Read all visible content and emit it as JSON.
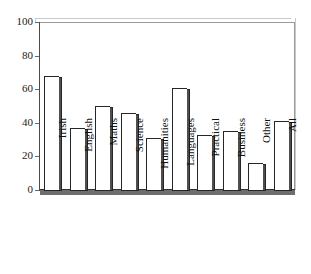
{
  "chart_data": {
    "type": "bar",
    "title": "",
    "xlabel": "",
    "ylabel": "",
    "ylim": [
      0,
      100
    ],
    "yticks": [
      0,
      20,
      40,
      60,
      80,
      100
    ],
    "grid": false,
    "legend": "none",
    "categories": [
      "Irish",
      "English",
      "Maths",
      "Science",
      "Humanities",
      "Languages",
      "Practical",
      "Business",
      "Other",
      "All"
    ],
    "values": [
      68,
      37,
      50,
      46,
      31,
      61,
      33,
      35,
      16,
      41
    ],
    "series": [
      {
        "name": "percentage",
        "values": [
          68,
          37,
          50,
          46,
          31,
          61,
          33,
          35,
          16,
          41
        ]
      }
    ],
    "bar_style": {
      "fill": "#ffffff",
      "edge": "#262626",
      "shadow": "#4f4f4f"
    }
  },
  "axes": {
    "y_tick_labels": [
      "100",
      "80",
      "60",
      "40",
      "20",
      "0"
    ],
    "y_max": 100,
    "y_min": 0
  }
}
